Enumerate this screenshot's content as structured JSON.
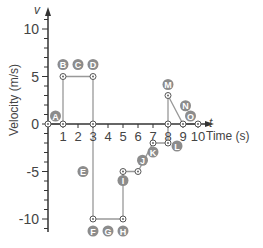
{
  "chart_data": {
    "type": "line",
    "title": "",
    "xlabel": "Time (s)",
    "ylabel": "Velocity (m/s)",
    "x_axis_symbol": "t",
    "y_axis_symbol": "v",
    "xlim": [
      0,
      10
    ],
    "ylim": [
      -10,
      10
    ],
    "x_ticks": [
      1,
      2,
      3,
      4,
      5,
      6,
      7,
      8,
      9,
      10
    ],
    "y_ticks": [
      10,
      5,
      0,
      -5,
      -10
    ],
    "grid": false,
    "series": [
      {
        "name": "velocity",
        "x": [
          0,
          1,
          1,
          3,
          3,
          3,
          5,
          5,
          6,
          7,
          8,
          8,
          8,
          9,
          10
        ],
        "y": [
          0,
          0,
          5,
          5,
          0,
          -10,
          -10,
          -5,
          -5,
          -2,
          -2,
          0,
          3,
          0,
          0
        ]
      }
    ],
    "annotations": [
      {
        "label": "A",
        "t": 0.5,
        "v": 0
      },
      {
        "label": "B",
        "t": 1,
        "v": 5
      },
      {
        "label": "C",
        "t": 2,
        "v": 5
      },
      {
        "label": "D",
        "t": 3,
        "v": 5
      },
      {
        "label": "E",
        "t": 3,
        "v": -5
      },
      {
        "label": "F",
        "t": 3,
        "v": -10
      },
      {
        "label": "G",
        "t": 4,
        "v": -10
      },
      {
        "label": "H",
        "t": 5,
        "v": -10
      },
      {
        "label": "I",
        "t": 5,
        "v": -5
      },
      {
        "label": "J",
        "t": 6.5,
        "v": -3.5
      },
      {
        "label": "K",
        "t": 7,
        "v": -2
      },
      {
        "label": "L",
        "t": 8,
        "v": -2
      },
      {
        "label": "M",
        "t": 8,
        "v": 3
      },
      {
        "label": "N",
        "t": 8.5,
        "v": 1.5
      },
      {
        "label": "O",
        "t": 9.5,
        "v": 0
      }
    ]
  },
  "colors": {
    "axis": "#333333",
    "line": "#999999",
    "label_bg": "#8c8c8c",
    "label_text": "#ffffff",
    "text": "#444444"
  }
}
